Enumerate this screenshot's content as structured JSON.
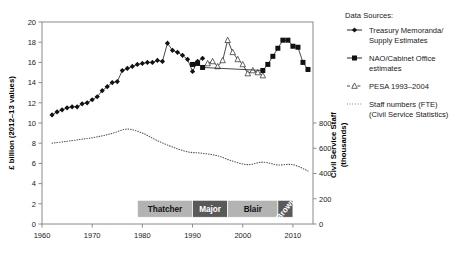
{
  "chart_data": {
    "type": "line",
    "title": "",
    "xlabel": "",
    "ylabel": "£ billion (2012–13 values)",
    "y2label": "Civil Service Staff (thousands)",
    "xlim": [
      1960,
      2014
    ],
    "ylim": [
      0,
      20
    ],
    "y2lim": [
      0,
      1600
    ],
    "grid": false,
    "legend_position": "right",
    "xticks": [
      1960,
      1970,
      1980,
      1990,
      2000,
      2010
    ],
    "yticks": [
      0,
      2,
      4,
      6,
      8,
      10,
      12,
      14,
      16,
      18,
      20
    ],
    "y2ticks": [
      0,
      200,
      400,
      600,
      800
    ],
    "series": [
      {
        "name": "Treasury Memoranda/Supply Estimates",
        "marker": "filled-diamond",
        "axis": "left",
        "x": [
          1962,
          1963,
          1964,
          1965,
          1966,
          1967,
          1968,
          1969,
          1970,
          1971,
          1972,
          1973,
          1974,
          1975,
          1976,
          1977,
          1978,
          1979,
          1980,
          1981,
          1982,
          1983,
          1984,
          1985,
          1986,
          1987,
          1988,
          1989,
          1990,
          1991,
          1992
        ],
        "values": [
          10.8,
          11.1,
          11.3,
          11.5,
          11.6,
          11.6,
          11.9,
          12.0,
          12.3,
          12.6,
          13.2,
          13.6,
          14.0,
          14.1,
          15.2,
          15.4,
          15.6,
          15.8,
          15.9,
          16.0,
          16.0,
          16.2,
          16.1,
          17.9,
          17.2,
          17.0,
          16.7,
          16.3,
          15.1,
          16.1,
          16.4
        ]
      },
      {
        "name": "PESA 1993–2004",
        "marker": "open-triangle",
        "axis": "left",
        "x": [
          1993,
          1994,
          1995,
          1996,
          1997,
          1998,
          1999,
          2000,
          2001,
          2002,
          2003,
          2004
        ],
        "values": [
          15.9,
          16.1,
          15.6,
          16.2,
          18.2,
          17.0,
          16.3,
          15.8,
          14.9,
          15.2,
          15.0,
          14.7
        ]
      },
      {
        "name": "NAO/Cabinet Office estimates",
        "marker": "filled-square",
        "axis": "left",
        "x": [
          1990,
          1991,
          1992,
          2004,
          2005,
          2006,
          2007,
          2008,
          2009,
          2010,
          2011,
          2012,
          2013
        ],
        "values": [
          15.8,
          15.9,
          15.5,
          15.2,
          15.8,
          16.6,
          17.4,
          18.2,
          18.2,
          17.6,
          17.5,
          16.0,
          15.3
        ]
      },
      {
        "name": "Staff numbers (FTE) (Civil Service Statistics)",
        "marker": "dotted",
        "axis": "right",
        "x": [
          1962,
          1965,
          1968,
          1971,
          1974,
          1977,
          1980,
          1983,
          1986,
          1989,
          1992,
          1995,
          1998,
          2001,
          2004,
          2007,
          2010,
          2013
        ],
        "values": [
          640,
          655,
          672,
          690,
          718,
          752,
          720,
          660,
          610,
          572,
          560,
          540,
          498,
          470,
          490,
          468,
          470,
          420
        ]
      }
    ],
    "annotations": [
      {
        "label": "Thatcher",
        "start": 1979,
        "end": 1990,
        "fill": "#b3b3b3",
        "text_color": "#111111",
        "rotated": false
      },
      {
        "label": "Major",
        "start": 1990,
        "end": 1997,
        "fill": "#595959",
        "text_color": "#ffffff",
        "rotated": false
      },
      {
        "label": "Blair",
        "start": 1997,
        "end": 2007,
        "fill": "#b3b3b3",
        "text_color": "#111111",
        "rotated": false
      },
      {
        "label": "Brown",
        "start": 2007,
        "end": 2010,
        "fill": "#595959",
        "text_color": "#ffffff",
        "rotated": true
      }
    ]
  },
  "legend": {
    "heading": "Data Sources:",
    "entries": [
      {
        "label_line1": "Treasury Memoranda/",
        "label_line2": "Supply Estimates",
        "marker": "filled-diamond"
      },
      {
        "label_line1": "NAO/Cabinet Office",
        "label_line2": "estimates",
        "marker": "filled-square"
      },
      {
        "label_line1": "PESA 1993–2004",
        "label_line2": "",
        "marker": "open-triangle"
      },
      {
        "label_line1": "Staff numbers (FTE)",
        "label_line2": "(Civil Service Statistics)",
        "marker": "dotted"
      }
    ]
  },
  "axes": {
    "y_left_title": "£ billion (2012–13 values)",
    "y_right_title_line1": "Civil Service Staff",
    "y_right_title_line2": "(thousands)"
  },
  "colors": {
    "marker_dark": "#111111",
    "axis": "#8a8a8a",
    "pm_light": "#b3b3b3",
    "pm_dark": "#595959",
    "dotted": "#555555"
  }
}
